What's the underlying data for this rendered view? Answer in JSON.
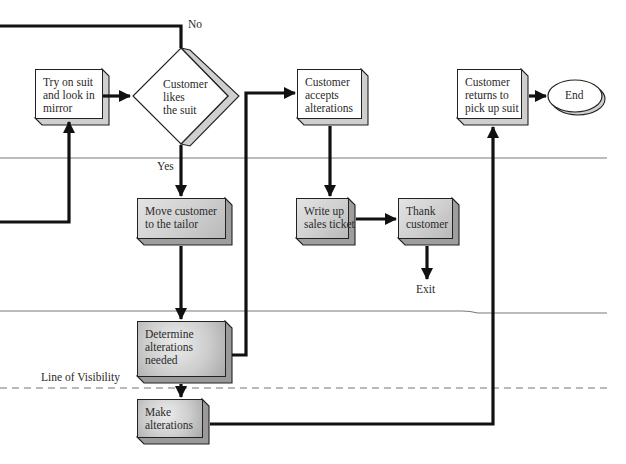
{
  "diagram": {
    "type": "service-blueprint",
    "labels": {
      "no": "No",
      "yes": "Yes",
      "exit": "Exit",
      "line_of_visibility": "Line of Visibility"
    },
    "nodes": {
      "try_on": {
        "lines": [
          "Try on suit",
          "and look in",
          "mirror"
        ],
        "shape": "box"
      },
      "likes": {
        "lines": [
          "Customer",
          "likes",
          "the suit"
        ],
        "shape": "decision"
      },
      "accepts": {
        "lines": [
          "Customer",
          "accepts",
          "alterations"
        ],
        "shape": "box"
      },
      "returns": {
        "lines": [
          "Customer",
          "returns to",
          "pick up suit"
        ],
        "shape": "box"
      },
      "end": {
        "lines": [
          "End"
        ],
        "shape": "terminal"
      },
      "move": {
        "lines": [
          "Move customer",
          "to the tailor"
        ],
        "shape": "box"
      },
      "write": {
        "lines": [
          "Write up",
          "sales ticket"
        ],
        "shape": "box"
      },
      "thank": {
        "lines": [
          "Thank",
          "customer"
        ],
        "shape": "box"
      },
      "determine": {
        "lines": [
          "Determine",
          "alterations",
          "needed"
        ],
        "shape": "box"
      },
      "make": {
        "lines": [
          "Make",
          "alterations"
        ],
        "shape": "box"
      }
    },
    "colors": {
      "line": "#111111",
      "divider": "#7a7a7a",
      "shadow": "#c8c8c8"
    }
  }
}
